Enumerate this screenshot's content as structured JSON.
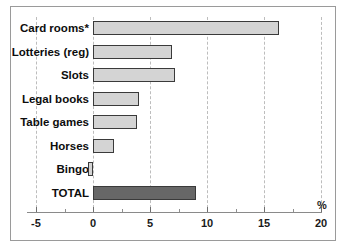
{
  "chart_data": {
    "type": "bar",
    "orientation": "horizontal",
    "title": "",
    "subtitle": "",
    "xlabel": "%",
    "ylabel": "",
    "xlim": [
      -5,
      20
    ],
    "xticks": [
      -5,
      0,
      5,
      10,
      15,
      20
    ],
    "xtick_labels": [
      "-5",
      "0",
      "5",
      "10",
      "15",
      "20"
    ],
    "minor_xticks": [
      -2.5,
      2.5,
      7.5,
      12.5,
      17.5
    ],
    "grid": true,
    "grid_style": "dashed vertical at major ticks",
    "legend": "none",
    "categories": [
      "Card rooms*",
      "Lotteries (reg)",
      "Slots",
      "Legal books",
      "Table games",
      "Horses",
      "Bingo",
      "TOTAL"
    ],
    "values": [
      16.3,
      6.9,
      7.2,
      4.0,
      3.9,
      1.8,
      -0.45,
      9.0
    ],
    "bars": [
      {
        "label": "Card rooms*",
        "value": 16.3,
        "style": "light"
      },
      {
        "label": "Lotteries (reg)",
        "value": 6.9,
        "style": "light"
      },
      {
        "label": "Slots",
        "value": 7.2,
        "style": "light"
      },
      {
        "label": "Legal books",
        "value": 4.0,
        "style": "light"
      },
      {
        "label": "Table games",
        "value": 3.9,
        "style": "light"
      },
      {
        "label": "Horses",
        "value": 1.8,
        "style": "light"
      },
      {
        "label": "Bingo",
        "value": -0.45,
        "style": "light"
      },
      {
        "label": "TOTAL",
        "value": 9.0,
        "style": "total"
      }
    ],
    "colors": {
      "bar_light_fill": "#d4d4d4",
      "bar_total_fill": "#676767",
      "bar_border": "#3a3a3a",
      "gridline": "#bdbdbd",
      "axis": "#8a8a8a",
      "frame_border": "#9a9a9a",
      "background": "#ffffff",
      "text": "#0d0d0d"
    }
  }
}
